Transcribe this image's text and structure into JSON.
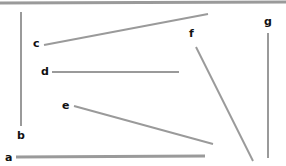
{
  "figure": {
    "title": "",
    "background_color": "#ffffff",
    "line_color": "#9a9a9a",
    "label_color": "#111111",
    "width": 286,
    "height": 166
  },
  "chart_data": {
    "type": "line",
    "title": "",
    "xlabel": "",
    "ylabel": "",
    "xlim": [
      0,
      286
    ],
    "ylim": [
      0,
      166
    ],
    "grid": false,
    "legend": "none",
    "segments": [
      {
        "id": "top-border",
        "label": "",
        "x1": 0,
        "y1": 3,
        "x2": 286,
        "y2": 2,
        "stroke_width": 3,
        "orientation": "horizontal"
      },
      {
        "id": "a",
        "label": "a",
        "x1": 16,
        "y1": 157,
        "x2": 205,
        "y2": 156,
        "stroke_width": 3,
        "orientation": "horizontal"
      },
      {
        "id": "b",
        "label": "b",
        "x1": 21,
        "y1": 12,
        "x2": 21,
        "y2": 126,
        "stroke_width": 2,
        "orientation": "vertical"
      },
      {
        "id": "c",
        "label": "c",
        "x1": 44,
        "y1": 45,
        "x2": 208,
        "y2": 14,
        "stroke_width": 2,
        "orientation": "diagonal"
      },
      {
        "id": "d",
        "label": "d",
        "x1": 52,
        "y1": 72,
        "x2": 179,
        "y2": 72,
        "stroke_width": 2,
        "orientation": "horizontal"
      },
      {
        "id": "e",
        "label": "e",
        "x1": 74,
        "y1": 106,
        "x2": 213,
        "y2": 144,
        "stroke_width": 2,
        "orientation": "diagonal"
      },
      {
        "id": "f",
        "label": "f",
        "x1": 196,
        "y1": 47,
        "x2": 253,
        "y2": 161,
        "stroke_width": 2,
        "orientation": "diagonal"
      },
      {
        "id": "g",
        "label": "g",
        "x1": 268,
        "y1": 33,
        "x2": 268,
        "y2": 158,
        "stroke_width": 2,
        "orientation": "vertical"
      }
    ],
    "labels": [
      {
        "text": "a",
        "x": 5,
        "y": 152
      },
      {
        "text": "b",
        "x": 17,
        "y": 130
      },
      {
        "text": "c",
        "x": 33,
        "y": 38
      },
      {
        "text": "d",
        "x": 41,
        "y": 66
      },
      {
        "text": "e",
        "x": 62,
        "y": 100
      },
      {
        "text": "f",
        "x": 189,
        "y": 28
      },
      {
        "text": "g",
        "x": 264,
        "y": 16
      }
    ]
  }
}
